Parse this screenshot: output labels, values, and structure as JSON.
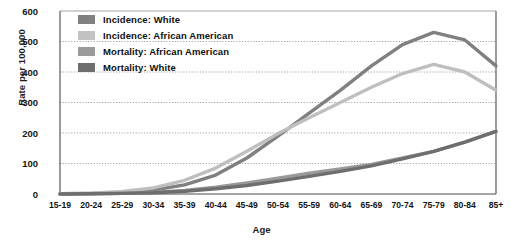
{
  "chart_data": {
    "type": "line",
    "title": "",
    "xlabel": "Age",
    "ylabel": "Rate per 100,000",
    "categories": [
      "15-19",
      "20-24",
      "25-29",
      "30-34",
      "35-39",
      "40-44",
      "45-49",
      "50-54",
      "55-59",
      "60-64",
      "65-69",
      "70-74",
      "75-79",
      "80-84",
      "85+"
    ],
    "ylim": [
      0,
      600
    ],
    "yticks": [
      0,
      100,
      200,
      300,
      400,
      500,
      600
    ],
    "grid": true,
    "legend_position": "top-left",
    "series": [
      {
        "name": "Incidence: White",
        "color": "#808080",
        "values": [
          1,
          2,
          5,
          13,
          30,
          62,
          118,
          190,
          265,
          340,
          420,
          490,
          530,
          505,
          420
        ]
      },
      {
        "name": "Incidence: African American",
        "color": "#bfbfbf",
        "values": [
          1,
          3,
          8,
          20,
          45,
          85,
          140,
          198,
          250,
          300,
          350,
          395,
          425,
          400,
          340
        ]
      },
      {
        "name": "Mortality: African American",
        "color": "#9a9a9a",
        "values": [
          0,
          1,
          2,
          5,
          12,
          22,
          36,
          52,
          68,
          82,
          97,
          118,
          140,
          170,
          205
        ]
      },
      {
        "name": "Mortality: White",
        "color": "#6e6e6e",
        "values": [
          0,
          1,
          2,
          4,
          9,
          17,
          28,
          42,
          58,
          74,
          92,
          115,
          140,
          170,
          205
        ]
      }
    ]
  },
  "axis": {
    "y_tick_labels": [
      "600",
      "500",
      "400",
      "300",
      "200",
      "100",
      "0"
    ],
    "y_title": "Rate per 100,000",
    "x_title": "Age"
  },
  "legend": {
    "items": [
      {
        "label": "Incidence: White",
        "color": "#808080"
      },
      {
        "label": "Incidence: African American",
        "color": "#c2c2c2"
      },
      {
        "label": "Mortality: African American",
        "color": "#9a9a9a"
      },
      {
        "label": "Mortality: White",
        "color": "#6e6e6e"
      }
    ]
  },
  "colors": {
    "axis_line": "#4c4c4c",
    "grid_line": "#9a9a9a",
    "plot_background": "#ffffff",
    "text": "#141414"
  }
}
